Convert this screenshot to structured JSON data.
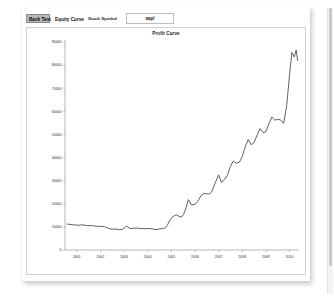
{
  "toolbar": {
    "tabs": [
      {
        "label": "Back Test",
        "selected": true
      },
      {
        "label": "Equity Curve",
        "selected": false
      }
    ],
    "symbol_label": "Stock Symbol",
    "symbol_value": "aapl",
    "symbol_placeholder": "symbol"
  },
  "chart_data": {
    "type": "line",
    "title": "Profit Curve",
    "xlabel": "",
    "ylabel": "",
    "grid": false,
    "legend": "none",
    "line_color": "#595959",
    "xlim": [
      2000.5,
      2010.4
    ],
    "ylim": [
      0,
      90000
    ],
    "xtick_labels": [
      "2001",
      "2002",
      "2003",
      "2004",
      "2005",
      "2006",
      "2007",
      "2008",
      "2009",
      "2010"
    ],
    "xticks": [
      2001,
      2002,
      2003,
      2004,
      2005,
      2006,
      2007,
      2008,
      2009,
      2010
    ],
    "ytick_labels": [
      "0",
      "10000",
      "20000",
      "30000",
      "40000",
      "50000",
      "60000",
      "70000",
      "80000",
      "90000"
    ],
    "yticks": [
      0,
      10000,
      20000,
      30000,
      40000,
      50000,
      60000,
      70000,
      80000,
      90000
    ],
    "series": [
      {
        "name": "Profit Curve",
        "x": [
          2000.6,
          2000.85,
          2001.05,
          2001.25,
          2001.45,
          2001.62,
          2001.8,
          2002.0,
          2002.18,
          2002.35,
          2002.5,
          2002.62,
          2002.78,
          2002.95,
          2003.1,
          2003.25,
          2003.4,
          2003.55,
          2003.7,
          2003.88,
          2004.02,
          2004.18,
          2004.35,
          2004.5,
          2004.62,
          2004.72,
          2004.82,
          2004.92,
          2005.02,
          2005.12,
          2005.22,
          2005.32,
          2005.42,
          2005.52,
          2005.62,
          2005.72,
          2005.85,
          2006.0,
          2006.12,
          2006.25,
          2006.38,
          2006.5,
          2006.62,
          2006.72,
          2006.85,
          2007.0,
          2007.12,
          2007.25,
          2007.38,
          2007.5,
          2007.62,
          2007.75,
          2007.88,
          2008.0,
          2008.12,
          2008.25,
          2008.38,
          2008.5,
          2008.62,
          2008.75,
          2008.88,
          2009.0,
          2009.12,
          2009.25,
          2009.38,
          2009.5,
          2009.62,
          2009.75,
          2009.88,
          2010.0,
          2010.1,
          2010.2,
          2010.28,
          2010.34
        ],
        "y": [
          11200,
          10900,
          10700,
          10900,
          10500,
          10600,
          10300,
          10200,
          10100,
          9300,
          9000,
          9100,
          8800,
          9000,
          10400,
          9300,
          9400,
          9500,
          9300,
          9200,
          9300,
          9200,
          8800,
          9100,
          9300,
          9500,
          10500,
          12600,
          14000,
          14800,
          15200,
          14600,
          14200,
          15500,
          18200,
          21800,
          19500,
          19800,
          21000,
          23500,
          24500,
          24300,
          24200,
          25500,
          28900,
          32500,
          29200,
          30500,
          32500,
          36200,
          38500,
          37600,
          38000,
          40500,
          44500,
          47800,
          45500,
          46500,
          49500,
          52500,
          50800,
          51200,
          54500,
          57500,
          56200,
          56500,
          56300,
          54800,
          62500,
          76000,
          85500,
          83500,
          86500,
          82000
        ]
      }
    ]
  }
}
